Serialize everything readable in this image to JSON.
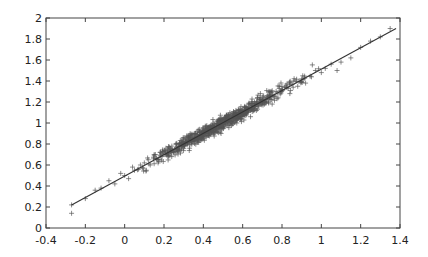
{
  "chart_data": {
    "type": "scatter",
    "title": "",
    "xlabel": "",
    "ylabel": "",
    "xlim": [
      -0.4,
      1.4
    ],
    "ylim": [
      0,
      2
    ],
    "xticks": [
      -0.4,
      -0.2,
      0,
      0.2,
      0.4,
      0.6,
      0.8,
      1,
      1.2,
      1.4
    ],
    "xtick_labels": [
      "-0.4",
      "-0.2",
      "0",
      "0.2",
      "0.4",
      "0.6",
      "0.8",
      "1",
      "1.2",
      "1.4"
    ],
    "yticks": [
      0,
      0.2,
      0.4,
      0.6,
      0.8,
      1,
      1.2,
      1.4,
      1.6,
      1.8,
      2
    ],
    "ytick_labels": [
      "0",
      "0.2",
      "0.4",
      "0.6",
      "0.8",
      "1",
      "1.2",
      "1.4",
      "1.6",
      "1.8",
      "2"
    ],
    "grid": false,
    "legend": null,
    "series": [
      {
        "name": "observations",
        "marker": "+",
        "color": "#555555",
        "x": [
          -0.27,
          -0.27,
          -0.2,
          -0.15,
          -0.12,
          -0.08,
          -0.05,
          -0.02,
          0.0,
          0.02,
          0.04,
          0.05,
          0.07,
          0.08,
          0.1,
          0.11,
          0.12,
          0.13,
          0.15,
          0.16,
          0.17,
          0.18,
          0.19,
          0.2,
          0.21,
          0.22,
          0.23,
          0.24,
          0.25,
          0.26,
          0.27,
          0.28,
          0.29,
          0.3,
          0.31,
          0.32,
          0.33,
          0.34,
          0.35,
          0.36,
          0.37,
          0.38,
          0.39,
          0.4,
          0.41,
          0.42,
          0.43,
          0.44,
          0.45,
          0.46,
          0.47,
          0.48,
          0.49,
          0.5,
          0.51,
          0.52,
          0.53,
          0.54,
          0.55,
          0.56,
          0.57,
          0.58,
          0.59,
          0.6,
          0.61,
          0.62,
          0.63,
          0.64,
          0.65,
          0.66,
          0.67,
          0.68,
          0.69,
          0.7,
          0.72,
          0.74,
          0.75,
          0.77,
          0.78,
          0.8,
          0.82,
          0.84,
          0.86,
          0.88,
          0.9,
          0.92,
          0.95,
          0.97,
          1.0,
          1.02,
          1.05,
          1.08,
          1.1,
          1.15,
          1.2,
          1.25,
          1.3,
          1.35
        ],
        "y": [
          0.22,
          0.14,
          0.28,
          0.36,
          0.38,
          0.45,
          0.42,
          0.52,
          0.5,
          0.47,
          0.58,
          0.55,
          0.56,
          0.6,
          0.62,
          0.55,
          0.65,
          0.6,
          0.7,
          0.66,
          0.62,
          0.72,
          0.68,
          0.7,
          0.76,
          0.68,
          0.74,
          0.78,
          0.72,
          0.8,
          0.75,
          0.74,
          0.83,
          0.79,
          0.85,
          0.8,
          0.76,
          0.88,
          0.84,
          0.9,
          0.82,
          0.94,
          0.86,
          0.9,
          0.97,
          0.88,
          0.95,
          0.92,
          1.0,
          0.94,
          1.02,
          0.96,
          0.9,
          1.0,
          1.05,
          0.98,
          1.08,
          1.02,
          1.06,
          1.1,
          1.0,
          1.12,
          1.04,
          1.08,
          1.15,
          1.1,
          1.18,
          1.06,
          1.14,
          1.2,
          1.12,
          1.16,
          1.28,
          1.2,
          1.22,
          1.26,
          1.18,
          1.3,
          1.24,
          1.32,
          1.36,
          1.28,
          1.4,
          1.35,
          1.42,
          1.38,
          1.44,
          1.5,
          1.48,
          1.52,
          1.56,
          1.5,
          1.58,
          1.62,
          1.72,
          1.78,
          1.82,
          1.9
        ]
      },
      {
        "name": "fit",
        "type": "line",
        "color": "#333333",
        "x": [
          -0.27,
          1.38
        ],
        "y": [
          0.22,
          1.9
        ]
      }
    ]
  }
}
